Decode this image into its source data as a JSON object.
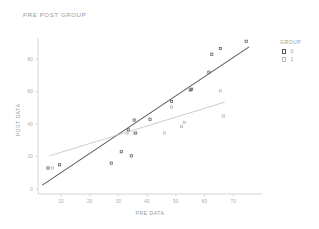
{
  "window": {
    "title": "PRE POST GROUP"
  },
  "legend": {
    "title": "GROUP",
    "entries": [
      {
        "label": "0",
        "color": "#5a5a5a",
        "marker": "square"
      },
      {
        "label": "1",
        "color": "#b8b8b8",
        "marker": "square"
      }
    ]
  },
  "chart_data": {
    "type": "scatter",
    "title": "PRE POST GROUP",
    "xlabel": "PRE DATA",
    "ylabel": "POST DATA",
    "xlim": [
      2,
      80
    ],
    "ylim": [
      -3,
      93
    ],
    "xticks": [
      10,
      20,
      30,
      40,
      50,
      60,
      70
    ],
    "yticks": [
      0,
      20,
      40,
      60,
      80
    ],
    "grid": false,
    "legend_position": "right",
    "legend_title": "GROUP",
    "series": [
      {
        "name": "0",
        "color": "#5a5a5a",
        "marker": "square",
        "points": [
          {
            "x": 5.5,
            "y": 13
          },
          {
            "x": 9.5,
            "y": 15
          },
          {
            "x": 27.5,
            "y": 16
          },
          {
            "x": 31.0,
            "y": 23
          },
          {
            "x": 33.5,
            "y": 36.5
          },
          {
            "x": 34.5,
            "y": 20.5
          },
          {
            "x": 35.5,
            "y": 42.5
          },
          {
            "x": 36.0,
            "y": 34.5
          },
          {
            "x": 41.0,
            "y": 43
          },
          {
            "x": 48.5,
            "y": 54
          },
          {
            "x": 55.0,
            "y": 61
          },
          {
            "x": 55.5,
            "y": 61.5
          },
          {
            "x": 61.5,
            "y": 72
          },
          {
            "x": 62.5,
            "y": 83
          },
          {
            "x": 65.5,
            "y": 86.5
          },
          {
            "x": 74.5,
            "y": 91
          }
        ],
        "fit_line": {
          "x0": 3.5,
          "y0": 2.5,
          "x1": 75.5,
          "y1": 87.5
        }
      },
      {
        "name": "1",
        "color": "#b8b8b8",
        "marker": "square",
        "points": [
          {
            "x": 7.0,
            "y": 13
          },
          {
            "x": 33.0,
            "y": 34.5
          },
          {
            "x": 35.5,
            "y": 34.5
          },
          {
            "x": 46.0,
            "y": 34.5
          },
          {
            "x": 48.5,
            "y": 50.5
          },
          {
            "x": 52.0,
            "y": 38.5
          },
          {
            "x": 53.0,
            "y": 41
          },
          {
            "x": 65.5,
            "y": 60.5
          },
          {
            "x": 66.5,
            "y": 45
          }
        ],
        "fit_line": {
          "x0": 6.0,
          "y0": 20.5,
          "x1": 67.0,
          "y1": 53.5
        }
      }
    ]
  }
}
